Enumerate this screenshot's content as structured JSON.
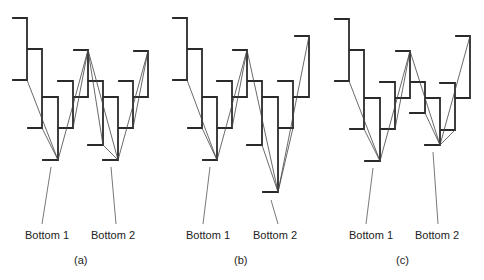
{
  "figure": {
    "panels": [
      {
        "id": "a",
        "caption": "(a)",
        "labels": {
          "bottom1": "Bottom 1",
          "bottom2": "Bottom 2"
        },
        "bottom2_variant": "equal to bottom 1"
      },
      {
        "id": "b",
        "caption": "(b)",
        "labels": {
          "bottom1": "Bottom 1",
          "bottom2": "Bottom 2"
        },
        "bottom2_variant": "lower than bottom 1"
      },
      {
        "id": "c",
        "caption": "(c)",
        "labels": {
          "bottom1": "Bottom 1",
          "bottom2": "Bottom 2"
        },
        "bottom2_variant": "higher than bottom 1"
      }
    ]
  },
  "colors": {
    "line": "#2a2a2a",
    "background": "#ffffff"
  }
}
